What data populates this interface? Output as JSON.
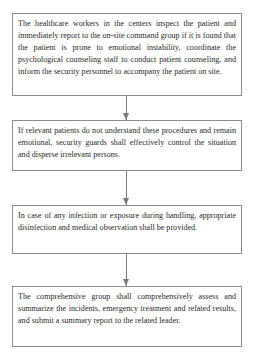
{
  "flowchart": {
    "steps": [
      {
        "text": "The healthcare workers in the centers inspect the patient and immediately report to the on-site command group if it is found that the patient is prone to emotional instability, coordinate the psychological counseling staff to conduct patient counseling, and inform the security personnel to accompany the patient on site."
      },
      {
        "text": "If relevant patients do not understand these procedures and remain emotional, security guards shall effectively control the situation and disperse irrelevant persons."
      },
      {
        "text": "In case of any infection or exposure during handling, appropriate disinfection and medical observation shall be provided."
      },
      {
        "text": "The comprehensive group shall comprehensively assess and summarize the incidents, emergency treatment and related results, and submit a summary report to the related leader."
      }
    ],
    "connectors": [
      "arrow-down",
      "arrow-down",
      "arrow-down"
    ]
  }
}
